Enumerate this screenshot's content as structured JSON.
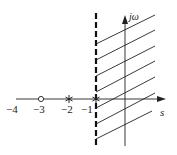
{
  "diagram": {
    "type": "s-plane",
    "axes": {
      "real_label": "s",
      "imag_label": "jω"
    },
    "tick_labels": [
      "−4",
      "−3",
      "−2",
      "−1"
    ],
    "markers": [
      {
        "kind": "zero",
        "symbol": "circle",
        "at": -3
      },
      {
        "kind": "pole",
        "symbol": "asterisk",
        "at": -2
      },
      {
        "kind": "pole",
        "symbol": "asterisk",
        "at": -1
      }
    ],
    "boundary": {
      "style": "dashed",
      "at": -1
    },
    "shaded_region": "Re(s) > -1",
    "colors": {
      "line": "#222222",
      "background": "#ffffff"
    }
  }
}
